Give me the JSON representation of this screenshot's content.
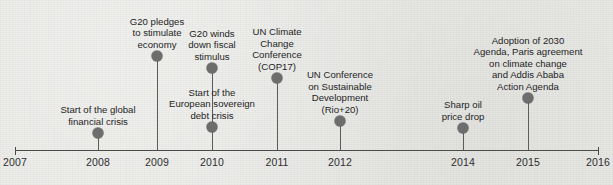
{
  "chart_data": {
    "type": "timeline",
    "title": "",
    "xlabel": "",
    "ylabel": "",
    "grid": false,
    "legend": "none",
    "axis": {
      "start_x": 15,
      "end_x": 598,
      "y": 150,
      "ticks": [
        {
          "label": "2007",
          "x": 15
        },
        {
          "label": "2008",
          "x": 98
        },
        {
          "label": "2009",
          "x": 157
        },
        {
          "label": "2010",
          "x": 212
        },
        {
          "label": "2011",
          "x": 277
        },
        {
          "label": "2012",
          "x": 340
        },
        {
          "label": "2014",
          "x": 463
        },
        {
          "label": "2015",
          "x": 528
        },
        {
          "label": "2016",
          "x": 598
        }
      ]
    },
    "events": [
      {
        "label": "Start of the global\nfinancial crisis",
        "year": "2008",
        "x": 98,
        "dot_y": 133,
        "label_bottom_y": 127,
        "label_width": 120
      },
      {
        "label": "G20 pledges\nto stimulate\neconomy",
        "year": "2009",
        "x": 157,
        "dot_y": 56,
        "label_bottom_y": 50,
        "label_width": 84
      },
      {
        "label": "G20 winds\ndown fiscal\nstimulus",
        "year": "2010",
        "x": 212,
        "dot_y": 68,
        "label_bottom_y": 62,
        "label_width": 80
      },
      {
        "label": "Start of the\nEuropean sovereign\ndebt crisis",
        "year": "2010",
        "x": 212,
        "dot_y": 127,
        "label_bottom_y": 121,
        "label_width": 112
      },
      {
        "label": "UN Climate\nChange\nConference\n(COP17)",
        "year": "2011",
        "x": 277,
        "dot_y": 78,
        "label_bottom_y": 72,
        "label_width": 78
      },
      {
        "label": "UN Conference\non Sustainable\nDevelopment\n(Rio+20)",
        "year": "2012",
        "x": 340,
        "dot_y": 121,
        "label_bottom_y": 115,
        "label_width": 92
      },
      {
        "label": "Sharp oil\nprice drop",
        "year": "2014",
        "x": 463,
        "dot_y": 128,
        "label_bottom_y": 122,
        "label_width": 76
      },
      {
        "label": "Adoption of 2030\nAgenda, Paris agreement\non climate change\nand Addis Ababa\nAction Agenda",
        "year": "2015",
        "x": 528,
        "dot_y": 98,
        "label_bottom_y": 92,
        "label_width": 130
      }
    ]
  },
  "style": {
    "background_color": "#e9e9e6",
    "axis_color": "#4a4a4a",
    "marker_color": "#6d6d6d",
    "text_color": "#1f1f1f"
  }
}
